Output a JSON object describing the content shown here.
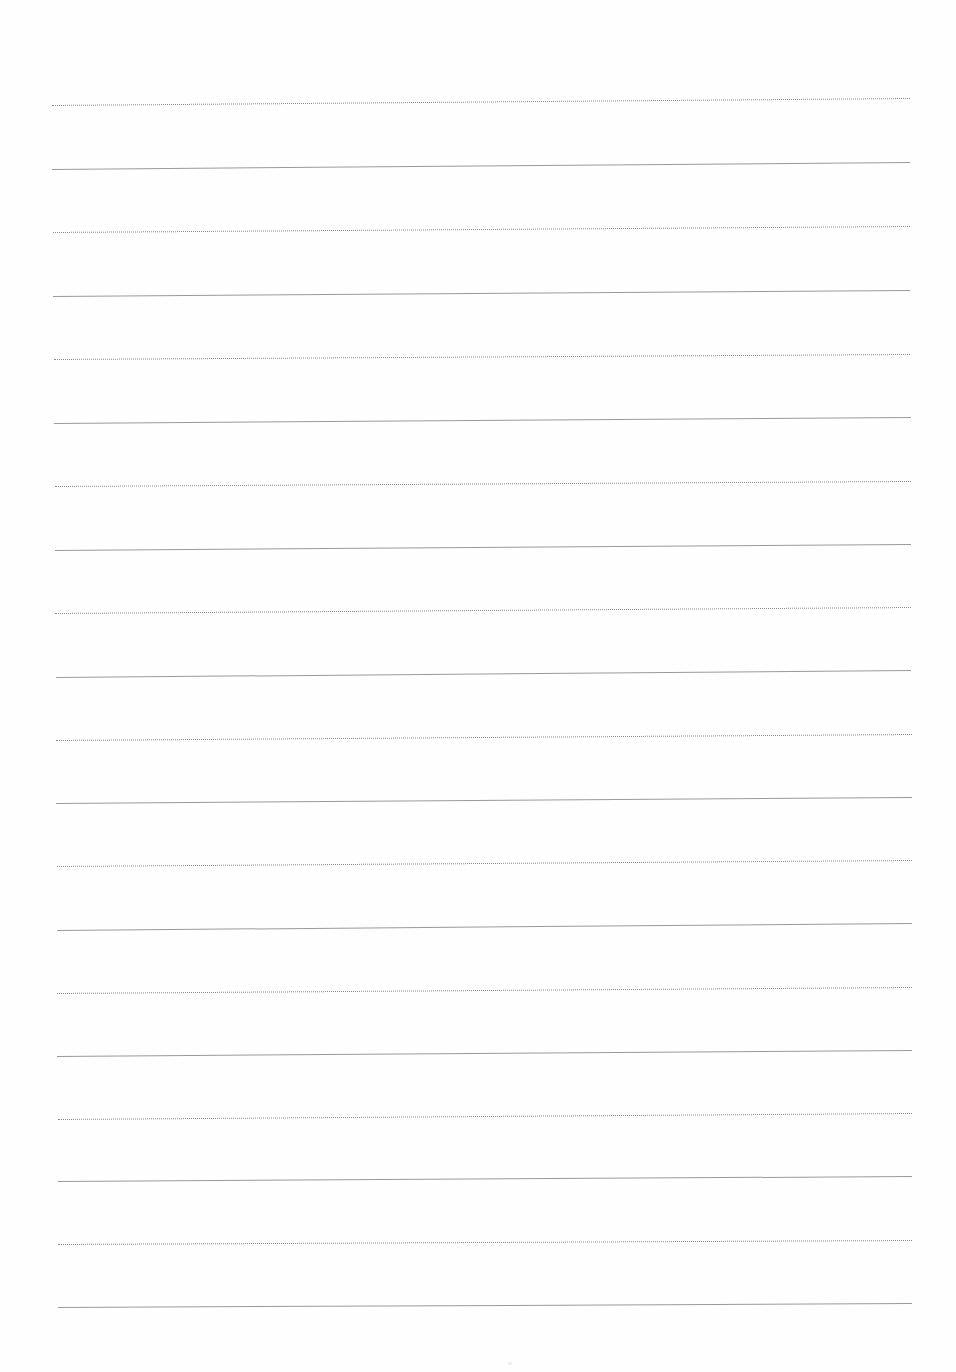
{
  "document": {
    "type": "lined-paper",
    "background_color": "#fefefe",
    "line_color_dotted": "#8a8a8a",
    "line_color_solid": "#9a9a9a",
    "lines": [
      {
        "style": "dotted",
        "x1": 52,
        "y1": 105,
        "x2": 910,
        "y2": 98
      },
      {
        "style": "solid",
        "x1": 52,
        "y1": 169,
        "x2": 910,
        "y2": 162
      },
      {
        "style": "dotted",
        "x1": 53,
        "y1": 232,
        "x2": 910,
        "y2": 226
      },
      {
        "style": "solid",
        "x1": 53,
        "y1": 296,
        "x2": 910,
        "y2": 290
      },
      {
        "style": "dotted",
        "x1": 54,
        "y1": 359,
        "x2": 910,
        "y2": 354
      },
      {
        "style": "solid",
        "x1": 54,
        "y1": 423,
        "x2": 911,
        "y2": 417
      },
      {
        "style": "dotted",
        "x1": 55,
        "y1": 486,
        "x2": 911,
        "y2": 481
      },
      {
        "style": "solid",
        "x1": 55,
        "y1": 550,
        "x2": 911,
        "y2": 544
      },
      {
        "style": "dotted",
        "x1": 55,
        "y1": 613,
        "x2": 911,
        "y2": 607
      },
      {
        "style": "solid",
        "x1": 56,
        "y1": 677,
        "x2": 911,
        "y2": 670
      },
      {
        "style": "dotted",
        "x1": 56,
        "y1": 740,
        "x2": 912,
        "y2": 734
      },
      {
        "style": "solid",
        "x1": 56,
        "y1": 803,
        "x2": 912,
        "y2": 797
      },
      {
        "style": "dotted",
        "x1": 57,
        "y1": 866,
        "x2": 912,
        "y2": 860
      },
      {
        "style": "solid",
        "x1": 57,
        "y1": 930,
        "x2": 912,
        "y2": 923
      },
      {
        "style": "dotted",
        "x1": 57,
        "y1": 993,
        "x2": 912,
        "y2": 987
      },
      {
        "style": "solid",
        "x1": 57,
        "y1": 1056,
        "x2": 912,
        "y2": 1050
      },
      {
        "style": "dotted",
        "x1": 58,
        "y1": 1119,
        "x2": 912,
        "y2": 1113
      },
      {
        "style": "solid",
        "x1": 58,
        "y1": 1181,
        "x2": 912,
        "y2": 1176
      },
      {
        "style": "dotted",
        "x1": 58,
        "y1": 1244,
        "x2": 912,
        "y2": 1240
      },
      {
        "style": "solid",
        "x1": 58,
        "y1": 1307,
        "x2": 912,
        "y2": 1303
      }
    ]
  }
}
